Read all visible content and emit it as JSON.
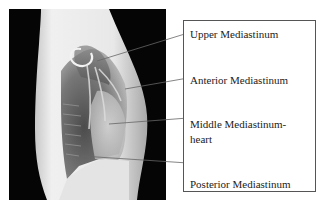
{
  "figure": {
    "image_description": "Lateral chest X-ray",
    "labels": [
      {
        "id": "upper",
        "text": "Upper Mediastinum"
      },
      {
        "id": "anterior",
        "text": "Anterior Mediastinum"
      },
      {
        "id": "middle",
        "text_line1": "Middle Mediastinum-",
        "text_line2": "heart"
      },
      {
        "id": "posterior",
        "text": "Posterior Mediastinum"
      }
    ],
    "colors": {
      "leader_line": "#666666",
      "box_border": "#555555",
      "text": "#222222",
      "xray_background": "#050505"
    }
  }
}
